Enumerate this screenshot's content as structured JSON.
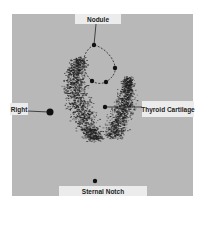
{
  "figure": {
    "type": "thyroid scintigraphy scan",
    "background_color": "#b8b8b8",
    "label_bg_color": "#ececec",
    "uptake_color": "#1e1e1e"
  },
  "labels": {
    "nodule": "Nodule",
    "thyroid_cartilage": "Thyroid Cartilage",
    "right": "Right",
    "sternal_notch": "Sternal Notch"
  },
  "markers": [
    {
      "name": "nodule-top-marker"
    },
    {
      "name": "nodule-right-marker"
    },
    {
      "name": "nodule-bottom-left-marker"
    },
    {
      "name": "nodule-bottom-right-marker"
    },
    {
      "name": "thyroid-cartilage-marker"
    },
    {
      "name": "right-side-marker"
    },
    {
      "name": "sternal-notch-marker"
    }
  ]
}
